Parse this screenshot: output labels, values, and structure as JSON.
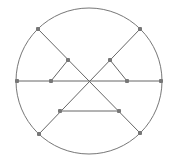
{
  "diagram": {
    "type": "geometric-graph",
    "canvas": {
      "width": 171,
      "height": 162,
      "background": "#ffffff"
    },
    "colors": {
      "stroke": "#666666",
      "circle": "#777777",
      "node": "#777777"
    },
    "circle": {
      "cx": 89,
      "cy": 81,
      "r": 73
    },
    "nodes": [
      {
        "id": "A",
        "x": 38,
        "y": 29
      },
      {
        "id": "B",
        "x": 140,
        "y": 29
      },
      {
        "id": "C",
        "x": 68,
        "y": 60
      },
      {
        "id": "D",
        "x": 110,
        "y": 60
      },
      {
        "id": "E",
        "x": 17,
        "y": 81
      },
      {
        "id": "F",
        "x": 51,
        "y": 81
      },
      {
        "id": "G",
        "x": 127,
        "y": 81
      },
      {
        "id": "H",
        "x": 161,
        "y": 81
      },
      {
        "id": "I",
        "x": 60,
        "y": 111
      },
      {
        "id": "J",
        "x": 119,
        "y": 111
      },
      {
        "id": "K",
        "x": 39,
        "y": 134
      },
      {
        "id": "L",
        "x": 140,
        "y": 133
      }
    ],
    "edges": [
      {
        "from": "A",
        "to": "L"
      },
      {
        "from": "B",
        "to": "K"
      },
      {
        "from": "E",
        "to": "H"
      },
      {
        "from": "C",
        "to": "F"
      },
      {
        "from": "D",
        "to": "G"
      },
      {
        "from": "I",
        "to": "J"
      }
    ]
  }
}
